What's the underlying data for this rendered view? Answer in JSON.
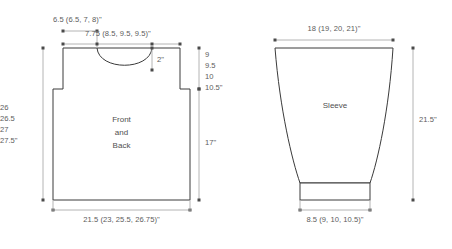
{
  "diagram": {
    "colors": {
      "outline": "#3a3a3a",
      "dimension_line": "#b4b4b4",
      "text": "#5c5c5c",
      "background": "#ffffff"
    }
  },
  "front_back": {
    "piece_label_line1": "Front",
    "piece_label_line2": "and",
    "piece_label_line3": "Back",
    "shoulder_width": "6.5 (6.5, 7, 8)\"",
    "neck_to_neck_width": "7.75 (8.5, 9.5, 9.5)\"",
    "neck_depth": "2\"",
    "armhole_depth_1": "9",
    "armhole_depth_2": "9.5",
    "armhole_depth_3": "10",
    "armhole_depth_4": "10.5\"",
    "body_length": "17\"",
    "total_length_1": "26",
    "total_length_2": "26.5",
    "total_length_3": "27",
    "total_length_4": "27.5\"",
    "bottom_width": "21.5 (23, 25.5, 26.75)\""
  },
  "sleeve": {
    "piece_label": "Sleeve",
    "upper_width": "18 (19, 20, 21)\"",
    "length": "21.5\"",
    "cuff_width": "8.5 (9, 10, 10.5)\""
  }
}
